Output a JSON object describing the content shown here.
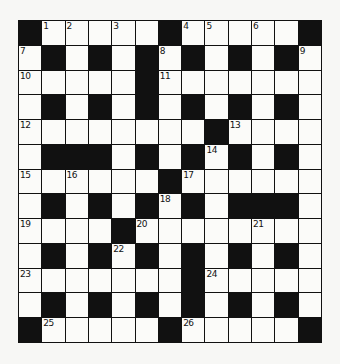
{
  "puzzle": {
    "type": "crossword",
    "rows": 13,
    "cols": 13,
    "colors": {
      "block": "#111111",
      "cell": "#fbfbf9",
      "background": "#f7f7f5"
    },
    "layout": [
      "#.....#.....#",
      ".#.#.#.#.#.#.",
      ".....#.......",
      ".#.#.#.#.#.#.",
      "........#....",
      ".###.#.#.#.#.",
      "......#......",
      ".#.#.#.#.###.",
      "....#........",
      ".#.#.#.#.#.#.",
      ".......#.....",
      ".#.#.#.#.#.#.",
      "#.....#.....#"
    ],
    "numbers": [
      {
        "n": "1",
        "r": 0,
        "c": 1
      },
      {
        "n": "2",
        "r": 0,
        "c": 2
      },
      {
        "n": "3",
        "r": 0,
        "c": 4
      },
      {
        "n": "4",
        "r": 0,
        "c": 7
      },
      {
        "n": "5",
        "r": 0,
        "c": 8
      },
      {
        "n": "6",
        "r": 0,
        "c": 10
      },
      {
        "n": "7",
        "r": 1,
        "c": 0
      },
      {
        "n": "8",
        "r": 1,
        "c": 6
      },
      {
        "n": "9",
        "r": 1,
        "c": 12
      },
      {
        "n": "10",
        "r": 2,
        "c": 0
      },
      {
        "n": "11",
        "r": 2,
        "c": 6
      },
      {
        "n": "12",
        "r": 4,
        "c": 0
      },
      {
        "n": "13",
        "r": 4,
        "c": 9
      },
      {
        "n": "14",
        "r": 5,
        "c": 8
      },
      {
        "n": "15",
        "r": 6,
        "c": 0
      },
      {
        "n": "16",
        "r": 6,
        "c": 2
      },
      {
        "n": "17",
        "r": 6,
        "c": 7
      },
      {
        "n": "18",
        "r": 7,
        "c": 6
      },
      {
        "n": "19",
        "r": 8,
        "c": 0
      },
      {
        "n": "20",
        "r": 8,
        "c": 5
      },
      {
        "n": "21",
        "r": 8,
        "c": 10
      },
      {
        "n": "22",
        "r": 9,
        "c": 4
      },
      {
        "n": "23",
        "r": 10,
        "c": 0
      },
      {
        "n": "24",
        "r": 10,
        "c": 8
      },
      {
        "n": "25",
        "r": 12,
        "c": 1
      },
      {
        "n": "26",
        "r": 12,
        "c": 7
      }
    ]
  }
}
